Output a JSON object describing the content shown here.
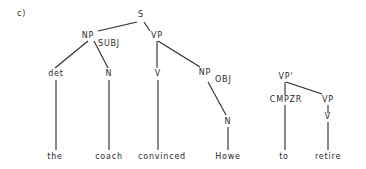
{
  "label": "c)",
  "nodes": [
    {
      "id": "S",
      "text": "S",
      "x": 141,
      "y": 17
    },
    {
      "id": "NP_SUBJ",
      "text": "NP",
      "x": 88,
      "y": 38,
      "sub": "SUBJ",
      "sx": 98,
      "sy": 46
    },
    {
      "id": "VP",
      "text": "VP",
      "x": 157,
      "y": 38
    },
    {
      "id": "det",
      "text": "det",
      "x": 56,
      "y": 76
    },
    {
      "id": "N1",
      "text": "N",
      "x": 109,
      "y": 76
    },
    {
      "id": "V1",
      "text": "V",
      "x": 158,
      "y": 76
    },
    {
      "id": "NP_OBJ",
      "text": "NP",
      "x": 205,
      "y": 75,
      "sub": "OBJ",
      "sx": 215,
      "sy": 82
    },
    {
      "id": "N2",
      "text": "N",
      "x": 228,
      "y": 124
    },
    {
      "id": "VPprime",
      "text": "VP'",
      "x": 286,
      "y": 79
    },
    {
      "id": "CMPZR",
      "text": "CMPZR",
      "x": 286,
      "y": 102
    },
    {
      "id": "VP2",
      "text": "VP",
      "x": 328,
      "y": 102
    },
    {
      "id": "V2",
      "text": "V",
      "x": 328,
      "y": 119
    }
  ],
  "words": [
    {
      "text": "the",
      "x": 55,
      "y": 159
    },
    {
      "text": "coach",
      "x": 109,
      "y": 159
    },
    {
      "text": "convinced",
      "x": 162,
      "y": 159
    },
    {
      "text": "Howe",
      "x": 228,
      "y": 159
    },
    {
      "text": "to",
      "x": 284,
      "y": 159
    },
    {
      "text": "retire",
      "x": 328,
      "y": 159
    }
  ],
  "edges": [
    [
      98,
      31,
      137,
      22
    ],
    [
      144,
      22,
      150,
      31
    ],
    [
      88,
      41,
      55,
      68
    ],
    [
      94,
      41,
      108,
      68
    ],
    [
      157,
      41,
      157,
      68
    ],
    [
      158,
      41,
      200,
      67
    ],
    [
      208,
      82,
      226,
      115
    ],
    [
      56,
      80,
      56,
      150
    ],
    [
      109,
      80,
      109,
      150
    ],
    [
      158,
      80,
      158,
      150
    ],
    [
      228,
      127,
      228,
      150
    ],
    [
      285,
      82,
      285,
      95
    ],
    [
      286,
      82,
      322,
      94
    ],
    [
      328,
      105,
      328,
      113
    ],
    [
      328,
      122,
      328,
      150
    ],
    [
      285,
      105,
      285,
      150
    ]
  ]
}
